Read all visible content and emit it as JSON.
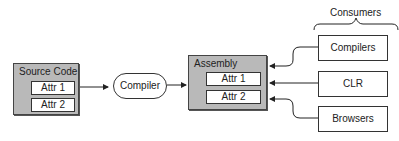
{
  "diagram": {
    "source_code": {
      "title": "Source Code",
      "attrs": [
        "Attr 1",
        "Attr 2"
      ]
    },
    "compiler": {
      "label": "Compiler"
    },
    "assembly": {
      "title": "Assembly",
      "attrs": [
        "Attr 1",
        "Attr 2"
      ]
    },
    "consumers": {
      "heading": "Consumers",
      "items": [
        "Compilers",
        "CLR",
        "Browsers"
      ]
    }
  }
}
